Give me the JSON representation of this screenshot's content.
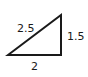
{
  "diagram": {
    "type": "right-triangle",
    "vertices": {
      "bottom_left": [
        8,
        55
      ],
      "top_right": [
        61,
        15
      ],
      "bottom_right": [
        61,
        55
      ]
    },
    "sides": {
      "hypotenuse": "2.5",
      "vertical_leg": "1.5",
      "base": "2"
    },
    "stroke_color": "#1a1a1a"
  }
}
